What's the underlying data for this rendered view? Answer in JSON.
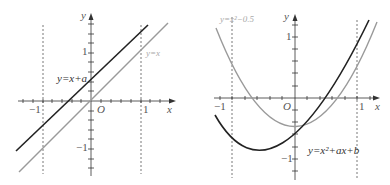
{
  "left_graph": {
    "axis_x_label": "x",
    "axis_y_label": "y",
    "origin_label": "O",
    "tick_x_neg": "−1",
    "tick_x_pos": "1",
    "tick_y_pos": "1",
    "tick_y_neg": "−1",
    "line_black_label": "y=x+a",
    "line_gray_label": "y=x",
    "colors": {
      "black": "#222222",
      "gray": "#9a9a9a"
    }
  },
  "right_graph": {
    "axis_x_label": "x",
    "axis_y_label": "y",
    "origin_label": "O",
    "tick_x_neg": "−1",
    "tick_x_pos": "1",
    "tick_y_pos": "1",
    "tick_y_neg": "−1",
    "curve_gray_label": "y=x²−0.5",
    "curve_black_label": "y=x²+ax+b",
    "colors": {
      "black": "#222222",
      "gray": "#9a9a9a"
    }
  }
}
